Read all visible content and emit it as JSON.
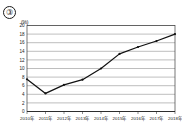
{
  "figure": {
    "item_number": "③",
    "unit_label": "(%)"
  },
  "chart_data": {
    "type": "line",
    "title": "",
    "xlabel": "",
    "ylabel": "(%)",
    "categories": [
      "2010年",
      "2011年",
      "2012年",
      "2013年",
      "2014年",
      "2015年",
      "2016年",
      "2017年",
      "2018年"
    ],
    "series": [
      {
        "name": "",
        "values": [
          7.5,
          4.2,
          6.2,
          7.4,
          10.0,
          13.4,
          15.0,
          16.4,
          18.0
        ]
      }
    ],
    "ylim": [
      0,
      20
    ],
    "ytick_values": [
      0,
      2,
      4,
      6,
      8,
      10,
      12,
      14,
      16,
      18,
      20
    ],
    "ytick_labels": [
      "0",
      "2",
      "4",
      "6",
      "8",
      "10",
      "12",
      "14",
      "16",
      "18",
      "20"
    ],
    "grid": true,
    "legend": "none",
    "markers": true
  }
}
